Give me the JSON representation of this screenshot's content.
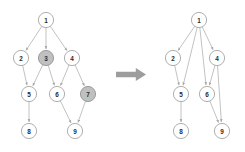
{
  "figure": {
    "width": 245,
    "height": 152,
    "background": "#ffffff",
    "node_fill": "#ffffff",
    "node_highlight_fill": "#c0c0c0",
    "node_stroke": "#9a9a9a",
    "edge_color": "#a8a8a8",
    "arrow_color": "#9d9d9d",
    "label_color": "#2b2b2b"
  },
  "transition_arrow": {
    "icon": "right-arrow-icon",
    "label": "",
    "color": "#9d9d9d",
    "x": 116,
    "y": 68,
    "width": 30,
    "height": 13
  },
  "left_graph": {
    "name": "original-graph",
    "radius": 7.6,
    "highlighted_nodes": [
      "3",
      "7"
    ],
    "nodes": [
      {
        "id": "1",
        "label": "1",
        "x": 46,
        "y": 20,
        "highlight": false
      },
      {
        "id": "2",
        "label": "2",
        "x": 21,
        "y": 58,
        "highlight": false
      },
      {
        "id": "3",
        "label": "3",
        "x": 46,
        "y": 58,
        "highlight": true
      },
      {
        "id": "4",
        "label": "4",
        "x": 72,
        "y": 58,
        "highlight": false
      },
      {
        "id": "5",
        "label": "5",
        "x": 29,
        "y": 94,
        "highlight": false
      },
      {
        "id": "6",
        "label": "6",
        "x": 57,
        "y": 94,
        "highlight": false
      },
      {
        "id": "7",
        "label": "7",
        "x": 88,
        "y": 94,
        "highlight": true
      },
      {
        "id": "8",
        "label": "8",
        "x": 29,
        "y": 131,
        "highlight": false
      },
      {
        "id": "9",
        "label": "9",
        "x": 75,
        "y": 131,
        "highlight": false
      }
    ],
    "edges": [
      {
        "from": "1",
        "to": "2"
      },
      {
        "from": "1",
        "to": "3"
      },
      {
        "from": "1",
        "to": "4"
      },
      {
        "from": "2",
        "to": "5"
      },
      {
        "from": "3",
        "to": "5"
      },
      {
        "from": "3",
        "to": "6"
      },
      {
        "from": "4",
        "to": "6"
      },
      {
        "from": "4",
        "to": "7"
      },
      {
        "from": "5",
        "to": "8"
      },
      {
        "from": "6",
        "to": "9"
      },
      {
        "from": "7",
        "to": "9"
      }
    ]
  },
  "right_graph": {
    "name": "reduced-graph",
    "radius": 7.6,
    "highlighted_nodes": [],
    "nodes": [
      {
        "id": "1",
        "label": "1",
        "x": 199,
        "y": 20,
        "highlight": false
      },
      {
        "id": "2",
        "label": "2",
        "x": 173,
        "y": 58,
        "highlight": false
      },
      {
        "id": "4",
        "label": "4",
        "x": 217,
        "y": 58,
        "highlight": false
      },
      {
        "id": "5",
        "label": "5",
        "x": 181,
        "y": 94,
        "highlight": false
      },
      {
        "id": "6",
        "label": "6",
        "x": 207,
        "y": 94,
        "highlight": false
      },
      {
        "id": "8",
        "label": "8",
        "x": 181,
        "y": 131,
        "highlight": false
      },
      {
        "id": "9",
        "label": "9",
        "x": 222,
        "y": 131,
        "highlight": false
      }
    ],
    "edges": [
      {
        "from": "1",
        "to": "2"
      },
      {
        "from": "1",
        "to": "5"
      },
      {
        "from": "1",
        "to": "6"
      },
      {
        "from": "1",
        "to": "4"
      },
      {
        "from": "2",
        "to": "5"
      },
      {
        "from": "4",
        "to": "6"
      },
      {
        "from": "4",
        "to": "9"
      },
      {
        "from": "5",
        "to": "8"
      },
      {
        "from": "6",
        "to": "9"
      }
    ]
  }
}
